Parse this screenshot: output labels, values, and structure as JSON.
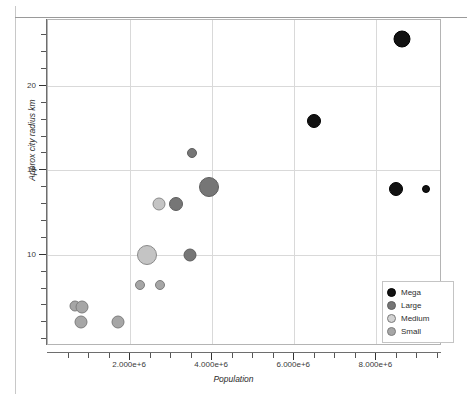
{
  "chart_data": {
    "type": "scatter",
    "title": "",
    "xlabel": "Population",
    "ylabel": "Approx city radius km",
    "xlim": [
      0,
      9600000
    ],
    "ylim": [
      4.6,
      23.9
    ],
    "grid": true,
    "legend_position": "bottom-right",
    "xticks": [
      2000000,
      4000000,
      6000000,
      8000000
    ],
    "xticklabels": [
      "2.000e+6",
      "4.000e+6",
      "6.000e+6",
      "8.000e+6"
    ],
    "yticks": [
      10,
      15,
      20
    ],
    "yticklabels": [
      "10",
      "15",
      "20"
    ],
    "size_encoding": "marker area scales with city importance",
    "series": [
      {
        "name": "Mega",
        "color": "#121212",
        "edge_color": "#000000",
        "points": [
          {
            "x": 8620000,
            "y": 22.8,
            "size": 17
          },
          {
            "x": 6480000,
            "y": 17.9,
            "size": 14
          },
          {
            "x": 8480000,
            "y": 13.9,
            "size": 14
          },
          {
            "x": 9220000,
            "y": 13.9,
            "size": 8
          }
        ]
      },
      {
        "name": "Large",
        "color": "#767676",
        "edge_color": "#5e5e5e",
        "points": [
          {
            "x": 3500000,
            "y": 16.0,
            "size": 10
          },
          {
            "x": 3930000,
            "y": 14.0,
            "size": 20
          },
          {
            "x": 3130000,
            "y": 13.0,
            "size": 14
          },
          {
            "x": 3450000,
            "y": 10.0,
            "size": 13
          }
        ]
      },
      {
        "name": "Medium",
        "color": "#c4c4c4",
        "edge_color": "#8a8a8a",
        "points": [
          {
            "x": 2700000,
            "y": 13.0,
            "size": 13
          },
          {
            "x": 2400000,
            "y": 10.0,
            "size": 20
          }
        ]
      },
      {
        "name": "Small",
        "color": "#a6a6a6",
        "edge_color": "#7d7d7d",
        "points": [
          {
            "x": 2250000,
            "y": 8.2,
            "size": 10
          },
          {
            "x": 2720000,
            "y": 8.2,
            "size": 10
          },
          {
            "x": 660000,
            "y": 6.95,
            "size": 11
          },
          {
            "x": 840000,
            "y": 6.9,
            "size": 13
          },
          {
            "x": 800000,
            "y": 6.0,
            "size": 13
          },
          {
            "x": 1700000,
            "y": 6.0,
            "size": 13
          }
        ]
      }
    ]
  },
  "legend": {
    "items": [
      {
        "label": "Mega",
        "color": "#121212",
        "edge": "#000000"
      },
      {
        "label": "Large",
        "color": "#767676",
        "edge": "#5e5e5e"
      },
      {
        "label": "Medium",
        "color": "#d2d2d2",
        "edge": "#7a7a7a"
      },
      {
        "label": "Small",
        "color": "#a6a6a6",
        "edge": "#7d7d7d"
      }
    ]
  },
  "axes": {
    "x_title": "Population",
    "y_title": "Approx city radius km"
  }
}
